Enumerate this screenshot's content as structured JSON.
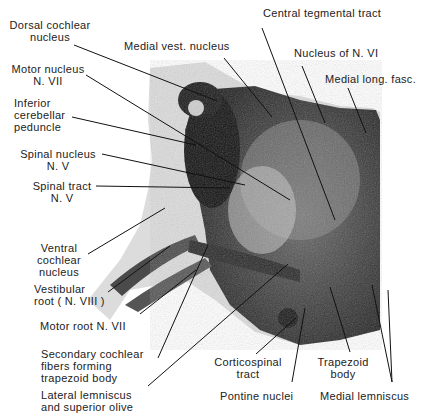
{
  "figure": {
    "type": "labeled brainstem section (pons, level of facial/abducens nuclei)",
    "labels": [
      {
        "id": "dorsal-cochlear",
        "lines": [
          "Dorsal cochlear",
          "nucleus"
        ],
        "x": 6,
        "y": 19,
        "align": "center",
        "w": 88
      },
      {
        "id": "medial-vest",
        "lines": [
          "Medial vest. nucleus"
        ],
        "x": 124,
        "y": 40
      },
      {
        "id": "central-tegmental",
        "lines": [
          "Central tegmental tract"
        ],
        "x": 263,
        "y": 7
      },
      {
        "id": "nucleus-vi",
        "lines": [
          "Nucleus of N. VI"
        ],
        "x": 294,
        "y": 47
      },
      {
        "id": "medial-long-fasc",
        "lines": [
          "Medial long. fasc."
        ],
        "x": 325,
        "y": 73
      },
      {
        "id": "motor-nucleus-vii",
        "lines": [
          "Motor nucleus",
          "N. VII"
        ],
        "x": 8,
        "y": 63,
        "align": "center",
        "w": 80
      },
      {
        "id": "inferior-cerebellar",
        "lines": [
          "Inferior",
          "cerebellar",
          "peduncle"
        ],
        "x": 14,
        "y": 97
      },
      {
        "id": "spinal-nucleus-v",
        "lines": [
          "Spinal nucleus",
          "N. V"
        ],
        "x": 18,
        "y": 148,
        "align": "center",
        "w": 80
      },
      {
        "id": "spinal-tract-v",
        "lines": [
          "Spinal tract",
          "N. V"
        ],
        "x": 28,
        "y": 180,
        "align": "center",
        "w": 68
      },
      {
        "id": "ventral-cochlear",
        "lines": [
          "Ventral",
          "cochlear",
          "nucleus"
        ],
        "x": 34,
        "y": 242,
        "align": "center",
        "w": 50
      },
      {
        "id": "vestibular-root",
        "lines": [
          "Vestibular",
          "root ( N. VIII )"
        ],
        "x": 34,
        "y": 283
      },
      {
        "id": "motor-root-vii",
        "lines": [
          "Motor root N. VII"
        ],
        "x": 40,
        "y": 320
      },
      {
        "id": "secondary-cochlear",
        "lines": [
          "Secondary cochlear",
          "fibers forming",
          "trapezoid body"
        ],
        "x": 41,
        "y": 348
      },
      {
        "id": "lateral-lemniscus",
        "lines": [
          "Lateral lemniscus",
          "and superior olive"
        ],
        "x": 41,
        "y": 389
      },
      {
        "id": "corticospinal",
        "lines": [
          "Corticospinal",
          "tract"
        ],
        "x": 208,
        "y": 356,
        "align": "center",
        "w": 80
      },
      {
        "id": "pontine-nuclei",
        "lines": [
          "Pontine nuclei"
        ],
        "x": 220,
        "y": 390
      },
      {
        "id": "trapezoid-body",
        "lines": [
          "Trapezoid",
          "body"
        ],
        "x": 316,
        "y": 356,
        "align": "center",
        "w": 54
      },
      {
        "id": "medial-lemniscus",
        "lines": [
          "Medial lemniscus"
        ],
        "x": 320,
        "y": 390
      }
    ],
    "leaders": [
      {
        "label": "dorsal-cochlear",
        "x1": 74,
        "y1": 45,
        "x2": 217,
        "y2": 101
      },
      {
        "label": "medial-vest",
        "x1": 224,
        "y1": 58,
        "x2": 272,
        "y2": 117
      },
      {
        "label": "central-tegmental",
        "x1": 262,
        "y1": 28,
        "x2": 335,
        "y2": 220
      },
      {
        "label": "nucleus-vi",
        "x1": 302,
        "y1": 66,
        "x2": 325,
        "y2": 123
      },
      {
        "label": "medial-long-fasc",
        "x1": 348,
        "y1": 88,
        "x2": 366,
        "y2": 133
      },
      {
        "label": "motor-nucleus-vii",
        "x1": 86,
        "y1": 75,
        "x2": 290,
        "y2": 200
      },
      {
        "label": "inferior-cerebellar",
        "x1": 72,
        "y1": 117,
        "x2": 196,
        "y2": 145
      },
      {
        "label": "spinal-nucleus-v",
        "x1": 102,
        "y1": 154,
        "x2": 245,
        "y2": 185
      },
      {
        "label": "spinal-tract-v",
        "x1": 96,
        "y1": 186,
        "x2": 230,
        "y2": 188
      },
      {
        "label": "ventral-cochlear",
        "x1": 88,
        "y1": 254,
        "x2": 165,
        "y2": 208
      },
      {
        "label": "vestibular-root",
        "x1": 108,
        "y1": 292,
        "x2": 170,
        "y2": 246
      },
      {
        "label": "motor-root-vii",
        "x1": 140,
        "y1": 314,
        "x2": 196,
        "y2": 270
      },
      {
        "label": "secondary-cochlear",
        "x1": 158,
        "y1": 358,
        "x2": 208,
        "y2": 245
      },
      {
        "label": "lateral-lemniscus",
        "x1": 148,
        "y1": 386,
        "x2": 288,
        "y2": 264
      },
      {
        "label": "corticospinal",
        "x1": 256,
        "y1": 354,
        "x2": 296,
        "y2": 318
      },
      {
        "label": "pontine-nuclei",
        "x1": 292,
        "y1": 382,
        "x2": 305,
        "y2": 308
      },
      {
        "label": "trapezoid-body",
        "x1": 350,
        "y1": 352,
        "x2": 330,
        "y2": 287
      },
      {
        "label": "medial-lemniscus-a",
        "x1": 392,
        "y1": 382,
        "x2": 388,
        "y2": 290
      },
      {
        "label": "medial-lemniscus-b",
        "x1": 392,
        "y1": 382,
        "x2": 372,
        "y2": 285
      }
    ]
  }
}
